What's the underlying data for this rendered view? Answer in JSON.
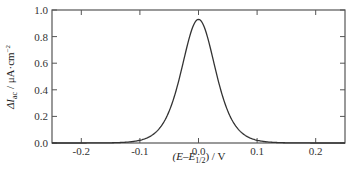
{
  "chart_data": {
    "type": "line",
    "title": "",
    "xlabel": "(E–E1/2) / V",
    "ylabel": "ΔIac / μA·cm⁻²",
    "xlim": [
      -0.25,
      0.25
    ],
    "ylim": [
      0.0,
      1.0
    ],
    "x_ticks": [
      -0.2,
      -0.1,
      0.0,
      0.1,
      0.2
    ],
    "x_tick_labels": [
      "-0.2",
      "-0.1",
      "0.0",
      "0.1",
      "0.2"
    ],
    "y_ticks": [
      0.0,
      0.2,
      0.4,
      0.6,
      0.8,
      1.0
    ],
    "y_tick_labels": [
      "0.0",
      "0.2",
      "0.4",
      "0.6",
      "0.8",
      "1.0"
    ],
    "grid": false,
    "legend": null,
    "series": [
      {
        "name": "AC voltammogram",
        "color": "#333333",
        "x": [
          -0.25,
          -0.2,
          -0.15,
          -0.1,
          -0.08,
          -0.06,
          -0.04,
          -0.02,
          0.0,
          0.02,
          0.04,
          0.06,
          0.08,
          0.1,
          0.15,
          0.2,
          0.25
        ],
        "y": [
          0.005,
          0.015,
          0.04,
          0.12,
          0.2,
          0.34,
          0.55,
          0.8,
          0.93,
          0.8,
          0.55,
          0.34,
          0.2,
          0.12,
          0.04,
          0.015,
          0.005
        ]
      }
    ],
    "peak": {
      "x": 0.0,
      "y": 0.93
    }
  },
  "axes": {
    "x_label_main": "(E–E",
    "x_label_sub": "1/2",
    "x_label_tail": ") / V",
    "y_label_main": "ΔI",
    "y_label_sub": "ac",
    "y_label_tail": " / μA·cm",
    "y_label_sup": "−2"
  }
}
